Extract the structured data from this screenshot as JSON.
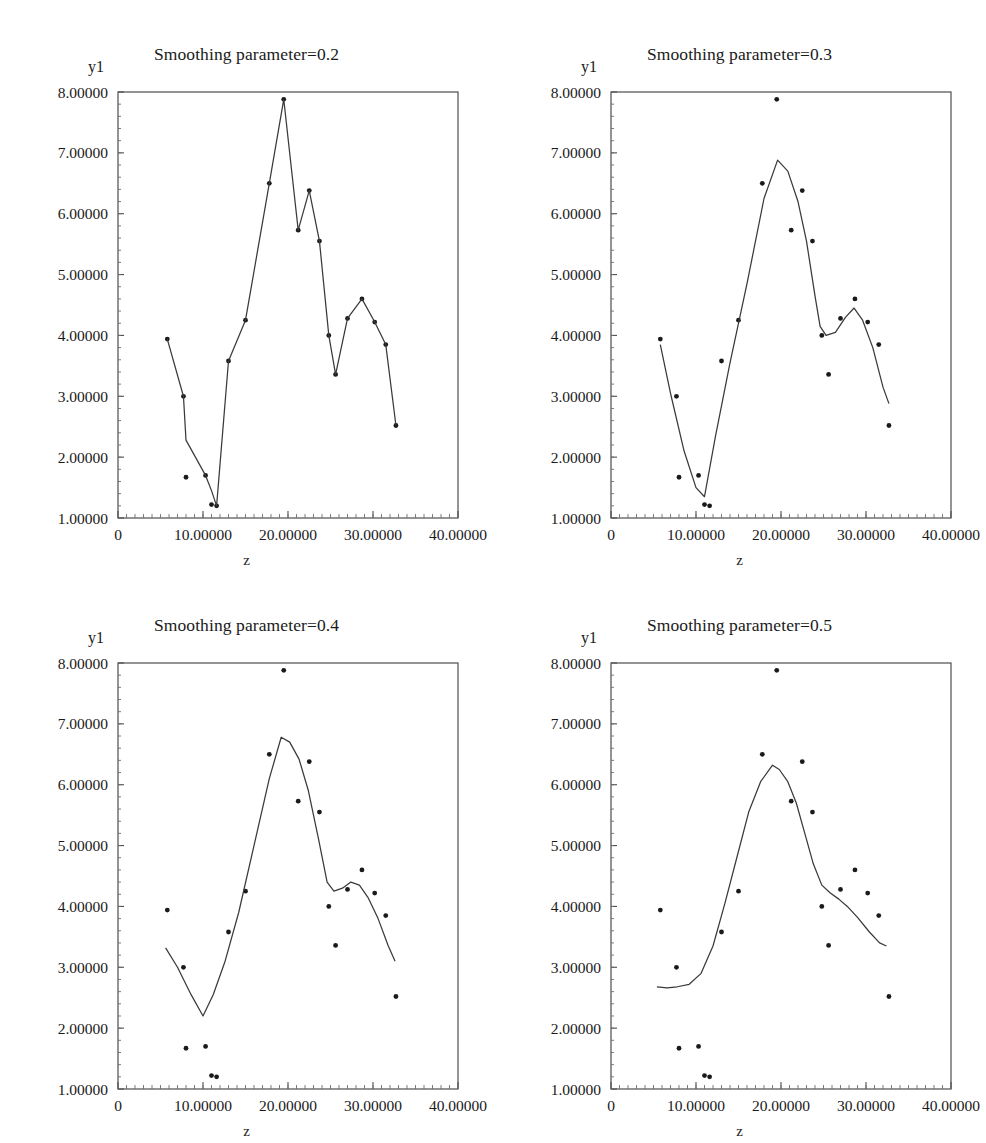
{
  "figure": {
    "panel_count": 4,
    "x_axis_label": "z",
    "y_axis_label": "y1"
  },
  "chart_data": [
    {
      "type": "line",
      "title": "Smoothing parameter=0.2",
      "xlabel": "z",
      "ylabel": "y1",
      "xlim": [
        0,
        40
      ],
      "ylim": [
        1,
        8
      ],
      "xticks": [
        "0",
        "10.00000",
        "20.00000",
        "30.00000",
        "40.00000"
      ],
      "xtick_values": [
        0,
        10,
        20,
        30,
        40
      ],
      "yticks": [
        "1.00000",
        "2.00000",
        "3.00000",
        "4.00000",
        "5.00000",
        "6.00000",
        "7.00000",
        "8.00000"
      ],
      "ytick_values": [
        1,
        2,
        3,
        4,
        5,
        6,
        7,
        8
      ],
      "grid": false,
      "legend": "none",
      "series": [
        {
          "name": "observed",
          "kind": "scatter",
          "x": [
            5.8,
            7.7,
            8.0,
            10.3,
            11.0,
            11.6,
            13.0,
            15.0,
            17.8,
            19.5,
            21.2,
            22.5,
            23.7,
            24.8,
            25.6,
            27.0,
            28.7,
            30.2,
            31.5,
            32.7
          ],
          "y": [
            3.94,
            3.0,
            1.67,
            1.7,
            1.22,
            1.2,
            3.58,
            4.25,
            6.5,
            7.88,
            5.73,
            6.38,
            5.55,
            4.0,
            3.36,
            4.28,
            4.6,
            4.22,
            3.85,
            2.52
          ]
        },
        {
          "name": "smooth",
          "kind": "line",
          "x": [
            5.8,
            7.7,
            8.0,
            10.3,
            11.0,
            11.6,
            13.0,
            15.0,
            17.8,
            19.5,
            21.2,
            22.5,
            23.7,
            24.8,
            25.6,
            27.0,
            28.7,
            30.2,
            31.5,
            32.7
          ],
          "y": [
            3.94,
            3.0,
            2.28,
            1.7,
            1.45,
            1.2,
            3.58,
            4.25,
            6.5,
            7.88,
            5.73,
            6.38,
            5.55,
            4.0,
            3.36,
            4.28,
            4.6,
            4.22,
            3.85,
            2.52
          ]
        }
      ]
    },
    {
      "type": "line",
      "title": "Smoothing parameter=0.3",
      "xlabel": "z",
      "ylabel": "y1",
      "xlim": [
        0,
        40
      ],
      "ylim": [
        1,
        8
      ],
      "xticks": [
        "0",
        "10.00000",
        "20.00000",
        "30.00000",
        "40.00000"
      ],
      "xtick_values": [
        0,
        10,
        20,
        30,
        40
      ],
      "yticks": [
        "1.00000",
        "2.00000",
        "3.00000",
        "4.00000",
        "5.00000",
        "6.00000",
        "7.00000",
        "8.00000"
      ],
      "ytick_values": [
        1,
        2,
        3,
        4,
        5,
        6,
        7,
        8
      ],
      "grid": false,
      "legend": "none",
      "series": [
        {
          "name": "observed",
          "kind": "scatter",
          "x": [
            5.8,
            7.7,
            8.0,
            10.3,
            11.0,
            11.6,
            13.0,
            15.0,
            17.8,
            19.5,
            21.2,
            22.5,
            23.7,
            24.8,
            25.6,
            27.0,
            28.7,
            30.2,
            31.5,
            32.7
          ],
          "y": [
            3.94,
            3.0,
            1.67,
            1.7,
            1.22,
            1.2,
            3.58,
            4.25,
            6.5,
            7.88,
            5.73,
            6.38,
            5.55,
            4.0,
            3.36,
            4.28,
            4.6,
            4.22,
            3.85,
            2.52
          ]
        },
        {
          "name": "smooth",
          "kind": "line",
          "x": [
            5.8,
            7.0,
            8.6,
            10.0,
            11.0,
            12.3,
            14.0,
            16.0,
            18.0,
            19.6,
            20.8,
            22.0,
            23.0,
            24.0,
            24.6,
            25.3,
            26.4,
            27.6,
            28.6,
            29.6,
            30.8,
            32.0,
            32.7
          ],
          "y": [
            3.85,
            3.05,
            2.1,
            1.5,
            1.35,
            2.35,
            3.55,
            4.85,
            6.25,
            6.88,
            6.7,
            6.2,
            5.55,
            4.65,
            4.15,
            4.0,
            4.05,
            4.3,
            4.45,
            4.25,
            3.8,
            3.15,
            2.88
          ]
        }
      ]
    },
    {
      "type": "line",
      "title": "Smoothing parameter=0.4",
      "xlabel": "z",
      "ylabel": "y1",
      "xlim": [
        0,
        40
      ],
      "ylim": [
        1,
        8
      ],
      "xticks": [
        "0",
        "10.00000",
        "20.00000",
        "30.00000",
        "40.00000"
      ],
      "xtick_values": [
        0,
        10,
        20,
        30,
        40
      ],
      "yticks": [
        "1.00000",
        "2.00000",
        "3.00000",
        "4.00000",
        "5.00000",
        "6.00000",
        "7.00000",
        "8.00000"
      ],
      "ytick_values": [
        1,
        2,
        3,
        4,
        5,
        6,
        7,
        8
      ],
      "grid": false,
      "legend": "none",
      "series": [
        {
          "name": "observed",
          "kind": "scatter",
          "x": [
            5.8,
            7.7,
            8.0,
            10.3,
            11.0,
            11.6,
            13.0,
            15.0,
            17.8,
            19.5,
            21.2,
            22.5,
            23.7,
            24.8,
            25.6,
            27.0,
            28.7,
            30.2,
            31.5,
            32.7
          ],
          "y": [
            3.94,
            3.0,
            1.67,
            1.7,
            1.22,
            1.2,
            3.58,
            4.25,
            6.5,
            7.88,
            5.73,
            6.38,
            5.55,
            4.0,
            3.36,
            4.28,
            4.6,
            4.22,
            3.85,
            2.52
          ]
        },
        {
          "name": "smooth",
          "kind": "line",
          "x": [
            5.6,
            7.0,
            8.6,
            10.0,
            11.2,
            12.6,
            14.2,
            16.0,
            17.8,
            19.2,
            20.2,
            21.3,
            22.4,
            23.6,
            24.6,
            25.4,
            26.4,
            27.4,
            28.4,
            29.4,
            30.6,
            31.8,
            32.6
          ],
          "y": [
            3.32,
            3.0,
            2.55,
            2.2,
            2.55,
            3.1,
            3.9,
            5.0,
            6.1,
            6.78,
            6.7,
            6.42,
            5.9,
            5.1,
            4.4,
            4.25,
            4.3,
            4.4,
            4.35,
            4.15,
            3.8,
            3.35,
            3.1
          ]
        }
      ]
    },
    {
      "type": "line",
      "title": "Smoothing parameter=0.5",
      "xlabel": "z",
      "ylabel": "y1",
      "xlim": [
        0,
        40
      ],
      "ylim": [
        1,
        8
      ],
      "xticks": [
        "0",
        "10.00000",
        "20.00000",
        "30.00000",
        "40.00000"
      ],
      "xtick_values": [
        0,
        10,
        20,
        30,
        40
      ],
      "yticks": [
        "1.00000",
        "2.00000",
        "3.00000",
        "4.00000",
        "5.00000",
        "6.00000",
        "7.00000",
        "8.00000"
      ],
      "ytick_values": [
        1,
        2,
        3,
        4,
        5,
        6,
        7,
        8
      ],
      "grid": false,
      "legend": "none",
      "series": [
        {
          "name": "observed",
          "kind": "scatter",
          "x": [
            5.8,
            7.7,
            8.0,
            10.3,
            11.0,
            11.6,
            13.0,
            15.0,
            17.8,
            19.5,
            21.2,
            22.5,
            23.7,
            24.8,
            25.6,
            27.0,
            28.7,
            30.2,
            31.5,
            32.7
          ],
          "y": [
            3.94,
            3.0,
            1.67,
            1.7,
            1.22,
            1.2,
            3.58,
            4.25,
            6.5,
            7.88,
            5.73,
            6.38,
            5.55,
            4.0,
            3.36,
            4.28,
            4.6,
            4.22,
            3.85,
            2.52
          ]
        },
        {
          "name": "smooth",
          "kind": "line",
          "x": [
            5.4,
            6.6,
            7.8,
            9.2,
            10.6,
            12.0,
            13.4,
            14.8,
            16.2,
            17.6,
            19.0,
            19.8,
            20.8,
            21.8,
            22.8,
            23.8,
            24.8,
            25.8,
            26.8,
            27.8,
            29.0,
            30.4,
            31.6,
            32.4
          ],
          "y": [
            2.68,
            2.66,
            2.68,
            2.72,
            2.9,
            3.35,
            4.05,
            4.8,
            5.55,
            6.05,
            6.32,
            6.25,
            6.05,
            5.7,
            5.2,
            4.7,
            4.35,
            4.22,
            4.12,
            4.0,
            3.82,
            3.58,
            3.4,
            3.35
          ]
        }
      ]
    }
  ]
}
